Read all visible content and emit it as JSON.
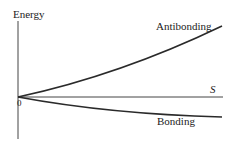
{
  "diagram": {
    "y_axis_label": "Energy",
    "x_axis_label": "S",
    "origin_label": "0",
    "curves": [
      {
        "name": "Antibonding",
        "label": "Antibonding",
        "direction": "up"
      },
      {
        "name": "Bonding",
        "label": "Bonding",
        "direction": "down"
      }
    ],
    "colors": {
      "line": "#2a2a2a",
      "axis": "#444444",
      "text": "#222222"
    }
  }
}
